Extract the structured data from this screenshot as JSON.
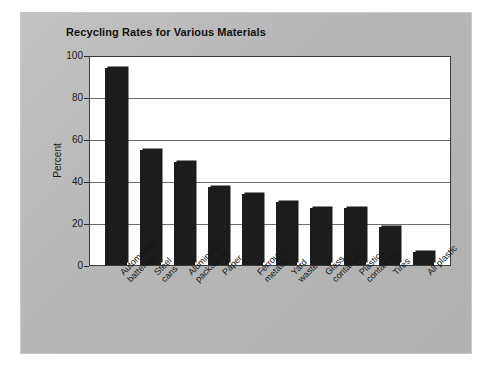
{
  "chart_data": {
    "type": "bar",
    "title": "Recycling Rates for Various Materials",
    "xlabel": "",
    "ylabel": "Percent",
    "ylim": [
      0,
      100
    ],
    "yticks": [
      0,
      20,
      40,
      60,
      80,
      100
    ],
    "ytick_labels": [
      "0",
      "20",
      "40",
      "60",
      "80",
      "100"
    ],
    "grid": true,
    "legend": false,
    "categories": [
      "Automobile\nbatteries",
      "Steel\ncans",
      "Aluminum\npackaging",
      "Paper",
      "Ferrous\nmetals",
      "Yard\nwaste",
      "Glass\ncontainers",
      "Plastic\ncontainers",
      "Tires",
      "All plastic"
    ],
    "values": [
      94,
      55,
      49,
      37,
      34,
      30,
      27,
      27,
      18,
      6
    ],
    "bar_color": "#1c1c1c",
    "plot_background": "#ffffff",
    "figure_background": "#b8b8b8"
  }
}
